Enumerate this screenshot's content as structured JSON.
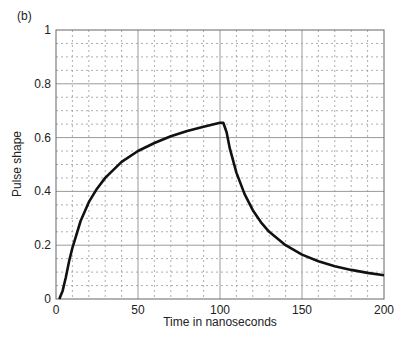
{
  "panel_label": "(b)",
  "chart_data": {
    "type": "line",
    "title": "",
    "xlabel": "Time in nanoseconds",
    "ylabel": "Pulse shape",
    "xlim": [
      0,
      200
    ],
    "ylim": [
      0,
      1
    ],
    "xticks": [
      0,
      50,
      100,
      150,
      200
    ],
    "yticks": [
      0,
      0.2,
      0.4,
      0.6,
      0.8,
      1
    ],
    "xtick_labels": [
      "0",
      "50",
      "100",
      "150",
      "200"
    ],
    "ytick_labels": [
      "0",
      "0.2",
      "0.4",
      "0.6",
      "0.8",
      "1"
    ],
    "grid": {
      "major": true,
      "minor": true,
      "minor_style": "dotted"
    },
    "legend": null,
    "series": [
      {
        "name": "pulse",
        "color": "#111111",
        "x": [
          2,
          4,
          6,
          8,
          10,
          12,
          15,
          20,
          25,
          30,
          35,
          40,
          50,
          60,
          70,
          80,
          90,
          100,
          102,
          104,
          106,
          110,
          115,
          120,
          125,
          130,
          140,
          150,
          160,
          170,
          180,
          190,
          200
        ],
        "y": [
          0.0,
          0.03,
          0.08,
          0.14,
          0.19,
          0.23,
          0.29,
          0.36,
          0.41,
          0.45,
          0.48,
          0.51,
          0.55,
          0.58,
          0.605,
          0.625,
          0.64,
          0.655,
          0.655,
          0.62,
          0.56,
          0.47,
          0.39,
          0.33,
          0.285,
          0.25,
          0.2,
          0.165,
          0.14,
          0.122,
          0.108,
          0.097,
          0.088
        ]
      }
    ]
  }
}
